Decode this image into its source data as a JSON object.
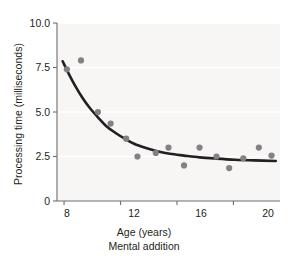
{
  "chart_data": {
    "type": "scatter",
    "title": "",
    "subtitle": "",
    "caption": "Mental addition",
    "xlabel": "Age (years)",
    "ylabel": "Processing time (milliseconds)",
    "xlim": [
      7.5,
      23.3
    ],
    "ylim": [
      0,
      10.0
    ],
    "xticks": [
      8,
      12,
      16,
      20
    ],
    "xtick_labels": [
      "8",
      "12",
      "16",
      "20"
    ],
    "yticks": [
      0,
      2.5,
      5.0,
      7.5,
      10.0
    ],
    "ytick_labels": [
      "0",
      "2.5",
      "5.0",
      "7.5",
      "10.0"
    ],
    "grid": "horizontal-faint",
    "legend": "none",
    "point_color": "#808285",
    "curve_color": "#231f20",
    "plot_background": "#f7f6f4",
    "series": [
      {
        "name": "Mental addition processing time",
        "kind": "points",
        "x": [
          8.2,
          9.2,
          10.4,
          11.3,
          12.4,
          13.2,
          14.5,
          15.4,
          16.5,
          17.6,
          18.8,
          19.7,
          20.7,
          21.8,
          22.7
        ],
        "y": [
          7.4,
          7.9,
          5.0,
          4.35,
          3.5,
          2.5,
          2.7,
          3.0,
          2.0,
          3.0,
          2.5,
          1.85,
          2.4,
          3.0,
          2.55
        ]
      },
      {
        "name": "Fitted decay curve",
        "kind": "line",
        "x": [
          7.9,
          8.3,
          8.8,
          9.3,
          9.8,
          10.4,
          11.0,
          11.6,
          12.3,
          13.0,
          13.8,
          14.6,
          15.5,
          16.5,
          17.6,
          18.8,
          20.1,
          21.5,
          23.0
        ],
        "y": [
          7.85,
          7.2,
          6.45,
          5.8,
          5.25,
          4.7,
          4.2,
          3.85,
          3.5,
          3.2,
          2.98,
          2.8,
          2.65,
          2.55,
          2.45,
          2.38,
          2.32,
          2.28,
          2.25
        ]
      }
    ]
  },
  "axes": {
    "y_tick_label_0": "0",
    "y_tick_label_1": "2.5",
    "y_tick_label_2": "5.0",
    "y_tick_label_3": "7.5",
    "y_tick_label_4": "10.0",
    "x_tick_label_0": "8",
    "x_tick_label_1": "12",
    "x_tick_label_2": "16",
    "x_tick_label_3": "20"
  }
}
